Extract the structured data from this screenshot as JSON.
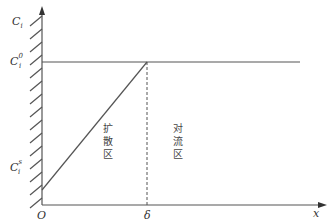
{
  "diagram": {
    "type": "concentration-profile",
    "axes": {
      "y_label": {
        "base": "C",
        "sub": "i"
      },
      "x_label": "x",
      "origin_label": "O"
    },
    "levels": {
      "bulk": {
        "base": "C",
        "sub": "i",
        "sup": "0"
      },
      "surface": {
        "base": "C",
        "sub": "i",
        "sup": "s"
      }
    },
    "boundary_label": "δ",
    "regions": {
      "diffusion": [
        "扩",
        "散",
        "区"
      ],
      "convection": [
        "对",
        "流",
        "区"
      ]
    },
    "colors": {
      "line": "#555555",
      "text": "#333333"
    }
  }
}
